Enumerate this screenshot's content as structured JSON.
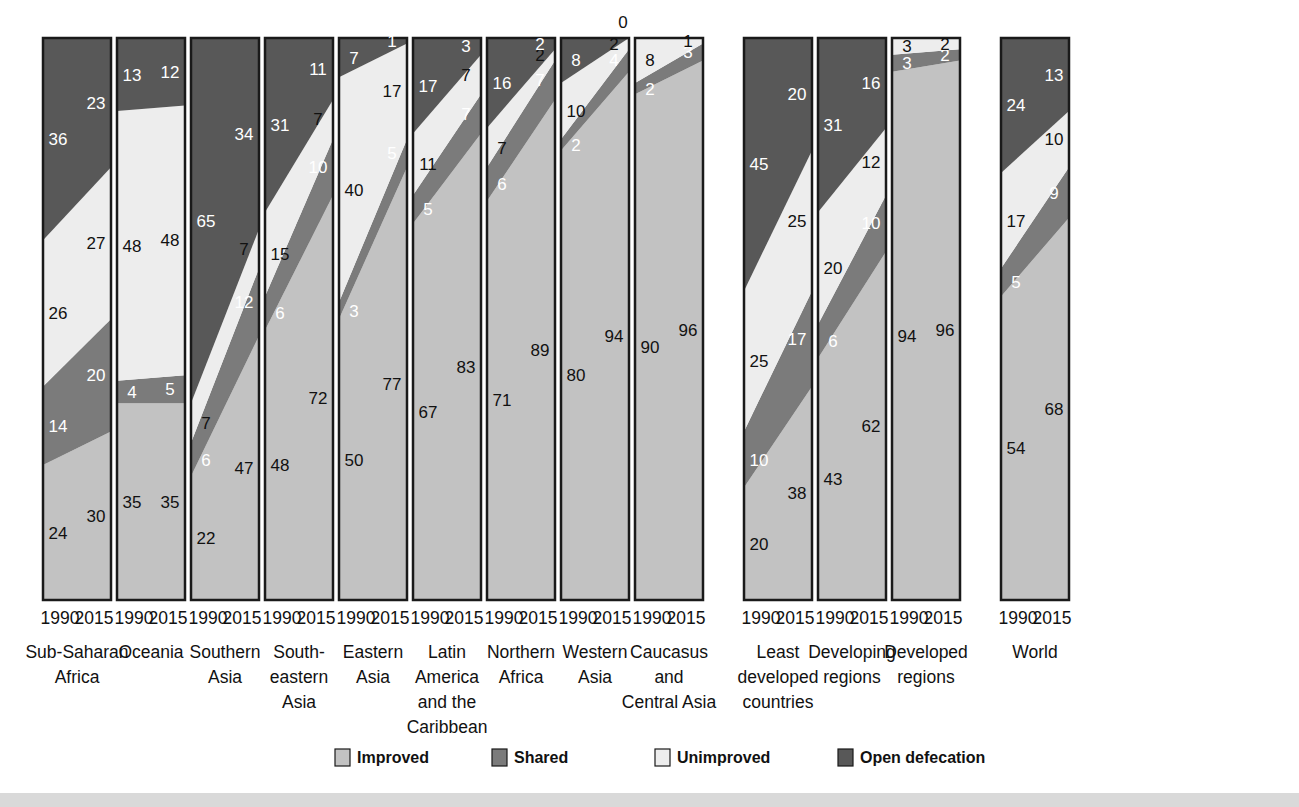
{
  "chart_data": {
    "type": "area",
    "title": "",
    "subtitle": "",
    "xlabel": "",
    "ylabel": "",
    "ylim": [
      0,
      100
    ],
    "grid": false,
    "legend_position": "bottom",
    "x": [
      "1990",
      "2015"
    ],
    "series_order": [
      "Improved",
      "Shared",
      "Unimproved",
      "Open defecation"
    ],
    "series_colors": {
      "Improved": "#c2c2c2",
      "Shared": "#7b7b7b",
      "Unimproved": "#ededed",
      "Open defecation": "#585858"
    },
    "groups": [
      {
        "name": "Sub-Saharan Africa",
        "label_lines": [
          "Sub-Saharan",
          "Africa"
        ],
        "gap_after": false,
        "values": {
          "Improved": [
            24,
            30
          ],
          "Shared": [
            14,
            20
          ],
          "Unimproved": [
            26,
            27
          ],
          "Open defecation": [
            36,
            23
          ]
        }
      },
      {
        "name": "Oceania",
        "label_lines": [
          "Oceania"
        ],
        "gap_after": false,
        "values": {
          "Improved": [
            35,
            35
          ],
          "Shared": [
            4,
            5
          ],
          "Unimproved": [
            48,
            48
          ],
          "Open defecation": [
            13,
            12
          ]
        }
      },
      {
        "name": "Southern Asia",
        "label_lines": [
          "Southern",
          "Asia"
        ],
        "gap_after": false,
        "values": {
          "Improved": [
            22,
            47
          ],
          "Shared": [
            6,
            12
          ],
          "Unimproved": [
            7,
            7
          ],
          "Open defecation": [
            65,
            34
          ]
        }
      },
      {
        "name": "South-eastern Asia",
        "label_lines": [
          "South-",
          "eastern",
          "Asia"
        ],
        "gap_after": false,
        "values": {
          "Improved": [
            48,
            72
          ],
          "Shared": [
            6,
            10
          ],
          "Unimproved": [
            15,
            7
          ],
          "Open defecation": [
            31,
            11
          ]
        }
      },
      {
        "name": "Eastern Asia",
        "label_lines": [
          "Eastern",
          "Asia"
        ],
        "gap_after": false,
        "values": {
          "Improved": [
            50,
            77
          ],
          "Shared": [
            3,
            5
          ],
          "Unimproved": [
            40,
            17
          ],
          "Open defecation": [
            7,
            1
          ]
        }
      },
      {
        "name": "Latin America and the Caribbean",
        "label_lines": [
          "Latin",
          "America",
          "and the",
          "Caribbean"
        ],
        "gap_after": false,
        "values": {
          "Improved": [
            67,
            83
          ],
          "Shared": [
            5,
            7
          ],
          "Unimproved": [
            11,
            7
          ],
          "Open defecation": [
            17,
            3
          ]
        }
      },
      {
        "name": "Northern Africa",
        "label_lines": [
          "Northern",
          "Africa"
        ],
        "gap_after": false,
        "values": {
          "Improved": [
            71,
            89
          ],
          "Shared": [
            6,
            7
          ],
          "Unimproved": [
            7,
            2
          ],
          "Open defecation": [
            16,
            2
          ]
        }
      },
      {
        "name": "Western Asia",
        "label_lines": [
          "Western",
          "Asia"
        ],
        "gap_after": false,
        "top_note": "0",
        "values": {
          "Improved": [
            80,
            94
          ],
          "Shared": [
            2,
            4
          ],
          "Unimproved": [
            10,
            2
          ],
          "Open defecation": [
            8,
            0
          ]
        }
      },
      {
        "name": "Caucasus and Central Asia",
        "label_lines": [
          "Caucasus",
          "and",
          "Central Asia"
        ],
        "gap_after": true,
        "values": {
          "Improved": [
            90,
            96
          ],
          "Shared": [
            2,
            3
          ],
          "Unimproved": [
            8,
            1
          ],
          "Open defecation": [
            0,
            0
          ]
        }
      },
      {
        "name": "Least developed countries",
        "label_lines": [
          "Least",
          "developed",
          "countries"
        ],
        "gap_after": false,
        "values": {
          "Improved": [
            20,
            38
          ],
          "Shared": [
            10,
            17
          ],
          "Unimproved": [
            25,
            25
          ],
          "Open defecation": [
            45,
            20
          ]
        }
      },
      {
        "name": "Developing regions",
        "label_lines": [
          "Developing",
          "regions"
        ],
        "gap_after": false,
        "values": {
          "Improved": [
            43,
            62
          ],
          "Shared": [
            6,
            10
          ],
          "Unimproved": [
            20,
            12
          ],
          "Open defecation": [
            31,
            16
          ]
        }
      },
      {
        "name": "Developed regions",
        "label_lines": [
          "Developed",
          "regions"
        ],
        "gap_after": true,
        "values": {
          "Improved": [
            94,
            96
          ],
          "Shared": [
            3,
            2
          ],
          "Unimproved": [
            3,
            2
          ],
          "Open defecation": [
            0,
            0
          ]
        }
      },
      {
        "name": "World",
        "label_lines": [
          "World"
        ],
        "gap_after": false,
        "values": {
          "Improved": [
            54,
            68
          ],
          "Shared": [
            5,
            9
          ],
          "Unimproved": [
            17,
            10
          ],
          "Open defecation": [
            24,
            13
          ]
        }
      }
    ],
    "legend": [
      {
        "label": "Improved",
        "color": "#c2c2c2"
      },
      {
        "label": "Shared",
        "color": "#7b7b7b"
      },
      {
        "label": "Unimproved",
        "color": "#ededed"
      },
      {
        "label": "Open defecation",
        "color": "#585858"
      }
    ]
  }
}
